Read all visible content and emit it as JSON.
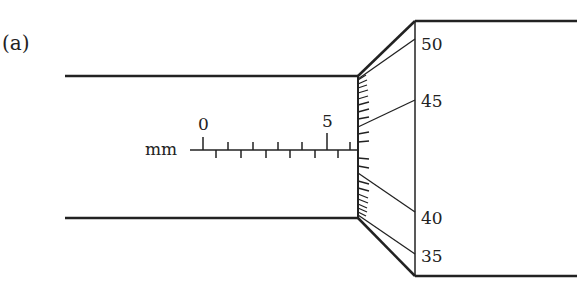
{
  "figure": {
    "part_label": "(a)"
  },
  "main_scale": {
    "unit": "mm",
    "labels": [
      {
        "text": "0",
        "value": 0
      },
      {
        "text": "5",
        "value": 5
      }
    ],
    "upper_ticks_mm": [
      0,
      1,
      2,
      3,
      4,
      5,
      6
    ],
    "lower_ticks_mm": [
      0.5,
      1.5,
      2.5,
      3.5,
      4.5,
      5.5
    ],
    "visible_range_mm": [
      0,
      6.5
    ]
  },
  "thimble_scale": {
    "labels": [
      "50",
      "45",
      "40",
      "35"
    ],
    "aligned_with_reference": 43
  },
  "colors": {
    "line": "#222222",
    "background": "#ffffff"
  }
}
